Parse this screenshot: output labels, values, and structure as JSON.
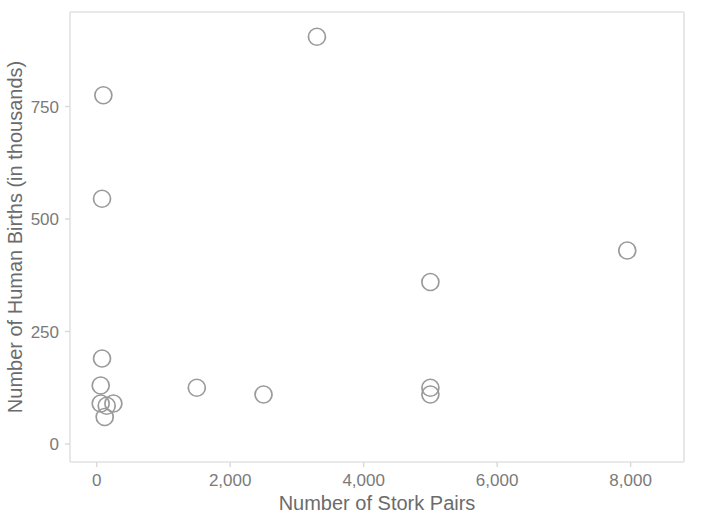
{
  "chart_data": {
    "type": "scatter",
    "title": "",
    "xlabel": "Number of Stork Pairs",
    "ylabel": "Number of Human Births (in thousands)",
    "xlim": [
      -400,
      8800
    ],
    "ylim": [
      -40,
      960
    ],
    "xticks": [
      0,
      2000,
      4000,
      6000,
      8000
    ],
    "xtick_labels": [
      "0",
      "2,000",
      "4,000",
      "6,000",
      "8,000"
    ],
    "yticks": [
      0,
      250,
      500,
      750
    ],
    "ytick_labels": [
      "0",
      "250",
      "500",
      "750"
    ],
    "grid": false,
    "legend": null,
    "marker": {
      "shape": "circle-open",
      "color": "#9a9a9a",
      "size": 11
    },
    "x": [
      60,
      60,
      120,
      150,
      250,
      80,
      80,
      100,
      1500,
      2500,
      3300,
      5000,
      5000,
      5000,
      7950
    ],
    "y": [
      130,
      90,
      60,
      85,
      90,
      190,
      545,
      775,
      125,
      110,
      905,
      110,
      125,
      360,
      430
    ],
    "points": [
      {
        "x": 60,
        "y": 130
      },
      {
        "x": 60,
        "y": 90
      },
      {
        "x": 120,
        "y": 60
      },
      {
        "x": 150,
        "y": 85
      },
      {
        "x": 250,
        "y": 90
      },
      {
        "x": 80,
        "y": 190
      },
      {
        "x": 80,
        "y": 545
      },
      {
        "x": 100,
        "y": 775
      },
      {
        "x": 1500,
        "y": 125
      },
      {
        "x": 2500,
        "y": 110
      },
      {
        "x": 3300,
        "y": 905
      },
      {
        "x": 5000,
        "y": 110
      },
      {
        "x": 5000,
        "y": 125
      },
      {
        "x": 5000,
        "y": 360
      },
      {
        "x": 7950,
        "y": 430
      }
    ]
  },
  "colors": {
    "marker_stroke": "#9a9a9a",
    "axis_line": "#e2e2e2",
    "tick_label": "#7a7a7a",
    "axis_title": "#6b6b6b",
    "background": "#ffffff"
  }
}
